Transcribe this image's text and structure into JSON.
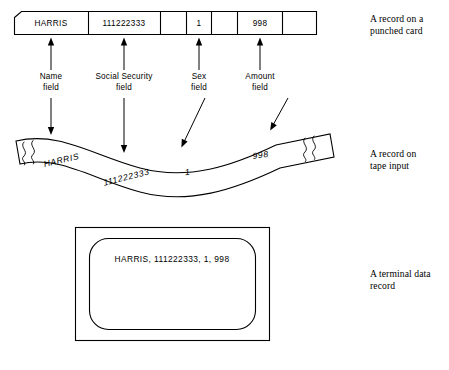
{
  "figure": {
    "record": {
      "name": "HARRIS",
      "social_security": "111222333",
      "sex": "1",
      "amount": "998"
    },
    "punched_card": {
      "cells": [
        {
          "value": "HARRIS",
          "filled": true
        },
        {
          "value": "111222333",
          "filled": true
        },
        {
          "value": "",
          "filled": false
        },
        {
          "value": "1",
          "filled": true
        },
        {
          "value": "",
          "filled": false
        },
        {
          "value": "998",
          "filled": true
        },
        {
          "value": "",
          "filled": false
        }
      ]
    },
    "field_labels": [
      {
        "line1": "Name",
        "line2": "field"
      },
      {
        "line1": "Social  Security",
        "line2": "field"
      },
      {
        "line1": "Sex",
        "line2": "field"
      },
      {
        "line1": "Amount",
        "line2": "field"
      }
    ],
    "tape": {
      "values": [
        "HARRIS",
        "111222333",
        "1",
        "998"
      ]
    },
    "terminal": {
      "line": "HARRIS, 111222333, 1, 998"
    },
    "captions": [
      {
        "line1": "A record on a",
        "line2": "punched card"
      },
      {
        "line1": "A record on",
        "line2": "tape input"
      },
      {
        "line1": "A terminal data",
        "line2": "record"
      }
    ]
  }
}
